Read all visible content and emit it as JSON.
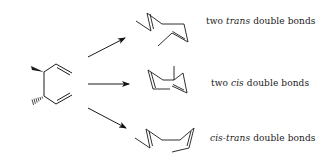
{
  "diagram": {
    "type": "reaction-scheme",
    "reactant": {
      "name": "starting-diene",
      "stereo": [
        "wedge-methyl",
        "hashed-methyl"
      ]
    },
    "arrows": [
      {
        "id": "arrow-top",
        "direction": "up-right"
      },
      {
        "id": "arrow-middle",
        "direction": "right"
      },
      {
        "id": "arrow-bottom",
        "direction": "down-right"
      }
    ],
    "products": [
      {
        "id": "product-trans-trans",
        "label_prefix": "two ",
        "label_italic": "trans",
        "label_suffix": " double bonds"
      },
      {
        "id": "product-cis-cis",
        "label_prefix": "two ",
        "label_italic": "cis",
        "label_suffix": " double bonds"
      },
      {
        "id": "product-cis-trans",
        "label_prefix": "",
        "label_italic": "cis-trans",
        "label_suffix": " double bonds"
      }
    ],
    "colors": {
      "stroke": "#1a1a1a",
      "background": "#ffffff"
    }
  }
}
